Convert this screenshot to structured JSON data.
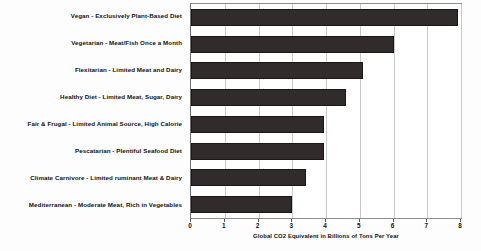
{
  "chart_data": {
    "type": "bar",
    "orientation": "horizontal",
    "title": "",
    "xlabel": "Global CO2 Equivalent in Billions of Tons Per Year",
    "ylabel": "",
    "xlim": [
      0,
      8
    ],
    "xticks": [
      0,
      1,
      2,
      3,
      4,
      5,
      6,
      7,
      8
    ],
    "xtick_labels": [
      "0",
      "1",
      "2",
      "3",
      "4",
      "5",
      "6",
      "7",
      "8"
    ],
    "grid": true,
    "grid_axis": "x",
    "legend": false,
    "legend_position": "none",
    "bar_color": "#322b2b",
    "categories": [
      "Vegan - Exclusively Plant-Based Diet",
      "Vegetarian - Meat/Fish Once a Month",
      "Flexitarian - Limited Meat and Dairy",
      "Healthy Diet - Limited Meat, Sugar, Dairy",
      "Fair & Frugal - Limited Animal Source, High Calorie",
      "Pescatarian - Plentiful Seafood Diet",
      "Climate Carnivore - Limited ruminant Meat & Dairy",
      "Mediterranean - Moderate Meat, Rich in Vegetables"
    ],
    "values": [
      7.9,
      6.0,
      5.1,
      4.6,
      3.95,
      3.95,
      3.4,
      3.0
    ]
  }
}
